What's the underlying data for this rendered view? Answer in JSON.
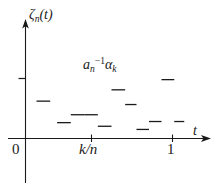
{
  "chart_data": {
    "type": "line",
    "title": "",
    "subtitle": "",
    "xlabel": "t",
    "ylabel": "ζₙ(t)",
    "annotation": "aₙ⁻¹αₖ",
    "grid": false,
    "legend": null,
    "axis": {
      "x_ticks": [
        "0",
        "k/n",
        "1"
      ],
      "x_tick_positions": [
        0,
        0.5,
        1.0
      ],
      "y_ticks": [
        ""
      ],
      "xlim": [
        0,
        1.12
      ],
      "ylim": [
        0,
        1.0
      ],
      "x_axis_arrow": true,
      "y_axis_arrow": true
    },
    "series": [
      {
        "name": "zeta_n",
        "style": "dashes",
        "color": "#1a1a1a",
        "segments": [
          {
            "x0": 0.075,
            "x1": 0.168,
            "y": 0.33
          },
          {
            "x0": 0.215,
            "x1": 0.308,
            "y": 0.14
          },
          {
            "x0": 0.308,
            "x1": 0.4,
            "y": 0.21
          },
          {
            "x0": 0.4,
            "x1": 0.492,
            "y": 0.21
          },
          {
            "x0": 0.492,
            "x1": 0.585,
            "y": 0.108
          },
          {
            "x0": 0.585,
            "x1": 0.678,
            "y": 0.43
          },
          {
            "x0": 0.678,
            "x1": 0.755,
            "y": 0.3
          },
          {
            "x0": 0.755,
            "x1": 0.84,
            "y": 0.08
          },
          {
            "x0": 0.84,
            "x1": 0.925,
            "y": 0.15
          },
          {
            "x0": 0.925,
            "x1": 1.012,
            "y": 0.52
          },
          {
            "x0": 1.012,
            "x1": 1.08,
            "y": 0.15
          }
        ]
      }
    ],
    "y_reference_tick": 0.53
  },
  "figure": {
    "y_axis_label": "ζ",
    "y_axis_sub": "n",
    "y_axis_arg": "(t)",
    "x_axis_label": "t",
    "tick_origin": "0",
    "tick_mid": "k/n",
    "tick_one": "1",
    "annotation_base": "a",
    "annotation_sub": "n",
    "annotation_sup": "−1",
    "annotation_alpha": "α",
    "annotation_alpha_sub": "k",
    "stroke_color": "#1a1a1a"
  }
}
